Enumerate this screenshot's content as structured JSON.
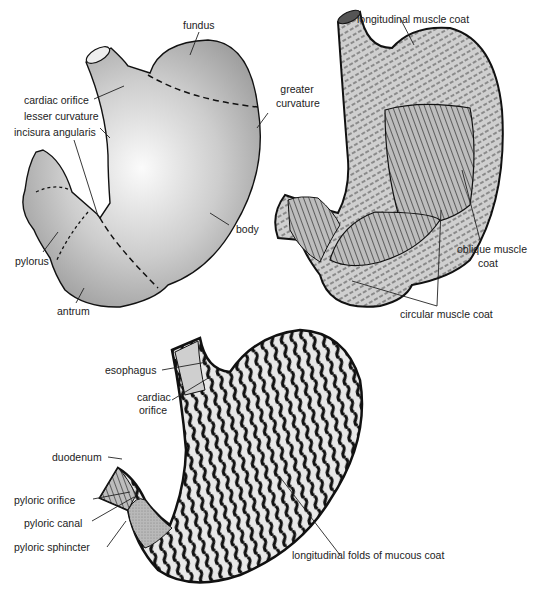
{
  "figure": {
    "panels": [
      {
        "id": "external-regions",
        "labels": {
          "fundus": "fundus",
          "cardiac_orifice": "cardiac orifice",
          "lesser_curvature": "lesser curvature",
          "incisura_angularis": "incisura angularis",
          "greater_curvature_1": "greater",
          "greater_curvature_2": "curvature",
          "body": "body",
          "pylorus": "pylorus",
          "antrum": "antrum"
        }
      },
      {
        "id": "muscle-layers",
        "labels": {
          "longitudinal_muscle_coat": "longitudinal muscle coat",
          "oblique_muscle_coat_1": "oblique muscle",
          "oblique_muscle_coat_2": "coat",
          "circular_muscle_coat": "circular muscle coat"
        }
      },
      {
        "id": "mucosa-interior",
        "labels": {
          "esophagus": "esophagus",
          "cardiac_orifice_1": "cardiac",
          "cardiac_orifice_2": "orifice",
          "duodenum": "duodenum",
          "pyloric_orifice": "pyloric orifice",
          "pyloric_canal": "pyloric canal",
          "pyloric_sphincter": "pyloric sphincter",
          "longitudinal_folds": "longitudinal folds of mucous coat"
        }
      }
    ],
    "colors": {
      "stomach_fill": "#a8a8a8",
      "stomach_highlight": "#f4f4f4",
      "outline": "#1a1a1a",
      "label_text": "#222222"
    }
  }
}
